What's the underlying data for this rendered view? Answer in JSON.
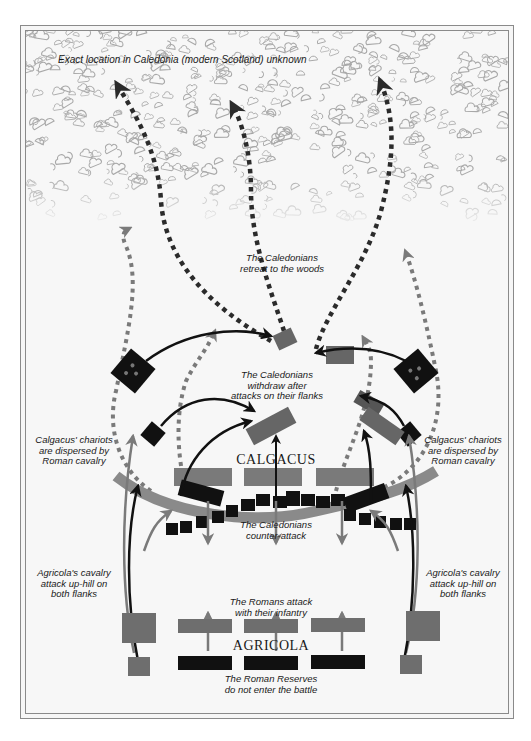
{
  "map": {
    "location_note": "Exact location in Caledonia (modern Scotland) unknown",
    "commanders": {
      "caledonian": "CALGACUS",
      "roman": "AGRICOLA"
    },
    "annotations": {
      "retreat": [
        "The Caledonians",
        "retreat to the woods"
      ],
      "withdraw": [
        "The Caledonians",
        "withdraw after",
        "attacks on their flanks"
      ],
      "counter_attack": [
        "The Caledonians",
        "counter-attack"
      ],
      "chariots_left": [
        "Calgacus' chariots",
        "are dispersed by",
        "Roman cavalry"
      ],
      "chariots_right": [
        "Calgacus' chariots",
        "are dispersed by",
        "Roman cavalry"
      ],
      "cavalry_left": [
        "Agricola's cavalry",
        "attack up-hill on",
        "both flanks"
      ],
      "cavalry_right": [
        "Agricola's cavalry",
        "attack up-hill on",
        "both flanks"
      ],
      "roman_attack": [
        "The Romans attack",
        "with their infantry"
      ],
      "reserves": [
        "The Roman Reserves",
        "do not enter the battle"
      ]
    },
    "legend_colors": {
      "roman_units": "#6e6e6e",
      "caledonian_units": "#111111",
      "roman_reserves": "#111111",
      "retreat_path": "#2b2b2b",
      "cavalry_path": "#7a7a7a",
      "woods_outline": "#a8a8a8",
      "background": "#f7f7f7"
    },
    "units": {
      "roman_infantry_lines": 3,
      "roman_reserve_lines": 3,
      "roman_cavalry_flanks": 2,
      "caledonian_front_lines": 3,
      "caledonian_chariot_groups": 4
    }
  }
}
